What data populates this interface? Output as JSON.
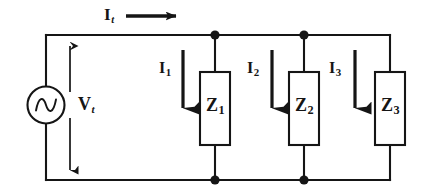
{
  "figure": {
    "name": "ac-parallel-impedance-circuit",
    "background_color": "#ffffff",
    "ink_color": "#151515"
  },
  "source": {
    "type": "ac-voltage-source",
    "symbol": "sine-wave"
  },
  "labels": {
    "total_current": {
      "base": "I",
      "sub": "t"
    },
    "total_voltage": {
      "base": "V",
      "sub": "t"
    },
    "branch1_current": {
      "base": "I",
      "sub": "1"
    },
    "branch2_current": {
      "base": "I",
      "sub": "2"
    },
    "branch3_current": {
      "base": "I",
      "sub": "3"
    },
    "impedance1": {
      "base": "Z",
      "sub": "1"
    },
    "impedance2": {
      "base": "Z",
      "sub": "2"
    },
    "impedance3": {
      "base": "Z",
      "sub": "3"
    }
  },
  "nodes": {
    "top": [
      {
        "x": 215,
        "y": 35
      },
      {
        "x": 304,
        "y": 35
      }
    ],
    "bottom": [
      {
        "x": 215,
        "y": 180
      },
      {
        "x": 304,
        "y": 180
      }
    ]
  },
  "impedance_boxes": [
    {
      "x": 200,
      "y": 72,
      "width": 30,
      "height": 73
    },
    {
      "x": 289,
      "y": 72,
      "width": 30,
      "height": 73
    },
    {
      "x": 375,
      "y": 72,
      "width": 30,
      "height": 73
    }
  ],
  "current_arrows": [
    {
      "x": 183,
      "y_start": 50,
      "y_end": 122,
      "direction": "down"
    },
    {
      "x": 272,
      "y_start": 50,
      "y_end": 122,
      "direction": "down"
    },
    {
      "x": 355,
      "y_start": 50,
      "y_end": 122,
      "direction": "down"
    }
  ],
  "total_current_arrow": {
    "x_start": 126,
    "x_end": 182,
    "y": 16,
    "direction": "right"
  },
  "voltage_arrow": {
    "x": 70,
    "y_start": 38,
    "y_end": 178,
    "direction": "double"
  }
}
